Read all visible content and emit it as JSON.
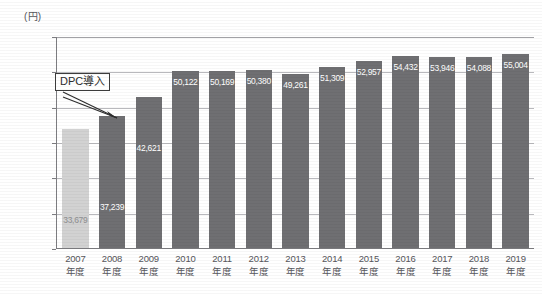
{
  "axis": {
    "y_unit_label": "(円)",
    "y_ticks": [
      "60,000",
      "50,000",
      "40,000",
      "30,000",
      "20,000",
      "10,000",
      "0"
    ]
  },
  "annotation": {
    "label": "DPC導入",
    "target_category": "2008年度"
  },
  "chart_data": {
    "type": "bar",
    "title": "",
    "xlabel": "",
    "ylabel": "(円)",
    "ylim": [
      0,
      60000
    ],
    "ytick_step": 10000,
    "grid": true,
    "legend": "none",
    "categories": [
      "2007年度",
      "2008年度",
      "2009年度",
      "2010年度",
      "2011年度",
      "2012年度",
      "2013年度",
      "2014年度",
      "2015年度",
      "2016年度",
      "2017年度",
      "2018年度",
      "2019年度"
    ],
    "category_years": [
      "2007",
      "2008",
      "2009",
      "2010",
      "2011",
      "2012",
      "2013",
      "2014",
      "2015",
      "2016",
      "2017",
      "2018",
      "2019"
    ],
    "category_suffix": "年度",
    "values": [
      33679,
      37239,
      42621,
      50122,
      50169,
      50380,
      49261,
      51309,
      52957,
      54432,
      53946,
      54088,
      55004
    ],
    "value_labels": [
      "33,679",
      "37,239",
      "42,621",
      "50,122",
      "50,169",
      "50,380",
      "49,261",
      "51,309",
      "52,957",
      "54,432",
      "53,946",
      "54,088",
      "55,004"
    ],
    "bar_colors": [
      "#d2d2d2",
      "#6f6f72",
      "#6f6f72",
      "#6f6f72",
      "#6f6f72",
      "#6f6f72",
      "#6f6f72",
      "#6f6f72",
      "#6f6f72",
      "#6f6f72",
      "#6f6f72",
      "#6f6f72",
      "#6f6f72"
    ],
    "annotations": [
      {
        "text": "DPC導入",
        "points_to": "2008年度"
      }
    ]
  },
  "colors": {
    "bar_primary": "#6f6f72",
    "bar_highlight": "#d2d2d2",
    "gridline": "#b9b9bd",
    "axis": "#7d7d81",
    "text": "#55555a",
    "value_text": "#ffffff"
  }
}
